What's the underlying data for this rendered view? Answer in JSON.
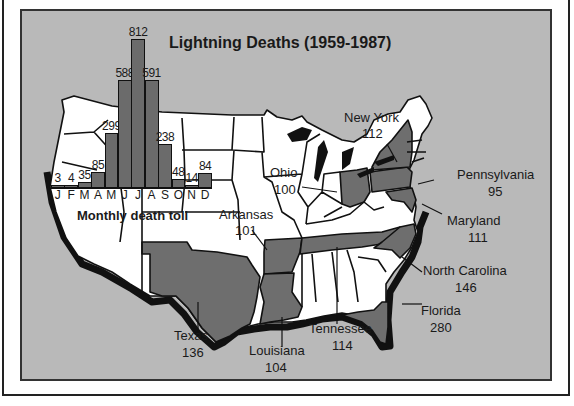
{
  "chart_data": [
    {
      "type": "bar",
      "title": "Monthly death toll",
      "categories": [
        "J",
        "F",
        "M",
        "A",
        "M",
        "J",
        "J",
        "A",
        "S",
        "O",
        "N",
        "D"
      ],
      "values": [
        3,
        4,
        35,
        85,
        299,
        588,
        812,
        591,
        238,
        48,
        14,
        84
      ],
      "xlabel": "",
      "ylabel": "",
      "ylim": [
        0,
        812
      ],
      "grid": false
    },
    {
      "type": "map",
      "title": "Lightning Deaths (1959-1987)",
      "regions": [
        {
          "state": "New York",
          "value": 112
        },
        {
          "state": "Ohio",
          "value": 100
        },
        {
          "state": "Pennsylvania",
          "value": 95
        },
        {
          "state": "Maryland",
          "value": 111
        },
        {
          "state": "Arkansas",
          "value": 101
        },
        {
          "state": "North Carolina",
          "value": 146
        },
        {
          "state": "Florida",
          "value": 280
        },
        {
          "state": "Texas",
          "value": 136
        },
        {
          "state": "Louisiana",
          "value": 104
        },
        {
          "state": "Tennessee",
          "value": 114
        }
      ]
    }
  ],
  "title": "Lightning Deaths (1959-1987)",
  "subtitle": "Monthly death toll",
  "colors": {
    "background": "#b9b9b9",
    "highlight_state": "#6e6e6e",
    "state": "#ffffff",
    "bar": "#6b6b6b"
  },
  "bars": [
    {
      "month": "J",
      "value": "3"
    },
    {
      "month": "F",
      "value": "4"
    },
    {
      "month": "M",
      "value": "35"
    },
    {
      "month": "A",
      "value": "85"
    },
    {
      "month": "M",
      "value": "299"
    },
    {
      "month": "J",
      "value": "588"
    },
    {
      "month": "J",
      "value": "812"
    },
    {
      "month": "A",
      "value": "591"
    },
    {
      "month": "S",
      "value": "238"
    },
    {
      "month": "O",
      "value": "48"
    },
    {
      "month": "N",
      "value": "14"
    },
    {
      "month": "D",
      "value": "84"
    }
  ],
  "labels": {
    "new_york": {
      "name": "New York",
      "value": "112"
    },
    "ohio": {
      "name": "Ohio",
      "value": "100"
    },
    "pennsylvania": {
      "name": "Pennsylvania",
      "value": "95"
    },
    "maryland": {
      "name": "Maryland",
      "value": "111"
    },
    "arkansas": {
      "name": "Arkansas",
      "value": "101"
    },
    "north_carolina": {
      "name": "North Carolina",
      "value": "146"
    },
    "florida": {
      "name": "Florida",
      "value": "280"
    },
    "texas": {
      "name": "Texas",
      "value": "136"
    },
    "louisiana": {
      "name": "Louisiana",
      "value": "104"
    },
    "tennessee": {
      "name": "Tennessee",
      "value": "114"
    }
  }
}
